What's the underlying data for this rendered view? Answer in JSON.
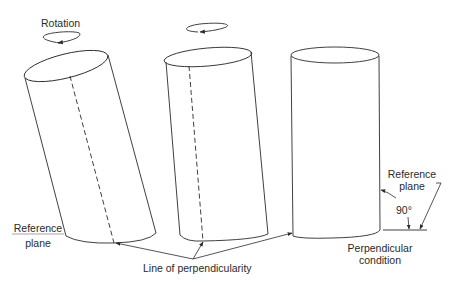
{
  "figure": {
    "labels": {
      "rotation": "Rotation",
      "reference_plane_left_line1": "Reference",
      "reference_plane_left_line2": "plane",
      "reference_plane_right_line1": "Reference",
      "reference_plane_right_line2": "plane",
      "angle": "90°",
      "line_of_perpendicularity": "Line of perpendicularity",
      "perpendicular_condition_line1": "Perpendicular",
      "perpendicular_condition_line2": "condition"
    },
    "cylinders": [
      {
        "name": "tilted-cylinder",
        "tilt": "large",
        "has_line_of_perpendicularity": true
      },
      {
        "name": "slightly-tilted-cylinder",
        "tilt": "small",
        "has_line_of_perpendicularity": true
      },
      {
        "name": "upright-cylinder",
        "tilt": "none",
        "angle_to_reference_plane": "90°"
      }
    ],
    "colors": {
      "stroke": "#2a2a2a",
      "reference_plane": "#9a9a9a",
      "background": "#ffffff"
    }
  }
}
